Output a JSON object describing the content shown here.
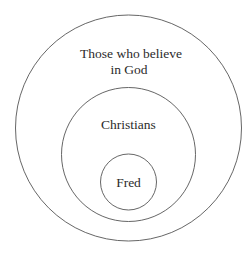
{
  "diagram": {
    "type": "nested-venn",
    "colors": {
      "background": "#ffffff",
      "stroke": "#555555",
      "text": "#2b2b2b"
    },
    "sets": [
      {
        "id": "outer",
        "label_lines": [
          "Those who believe",
          "in God"
        ],
        "cx": 128.5,
        "cy": 128,
        "r": 113
      },
      {
        "id": "middle",
        "label_lines": [
          "Christians"
        ],
        "cx": 128.5,
        "cy": 154.5,
        "r": 67
      },
      {
        "id": "inner",
        "label_lines": [
          "Fred"
        ],
        "cx": 128.5,
        "cy": 182,
        "r": 28
      }
    ]
  }
}
